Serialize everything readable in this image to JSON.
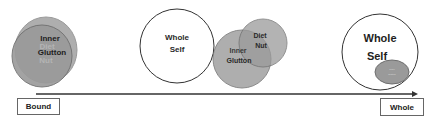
{
  "stages": {
    "bound": {
      "label": "Bound",
      "circles": [
        "Inner Glutton",
        "Diet Nut"
      ],
      "text_lines": [
        "Inner",
        "Diet",
        "Glutton",
        "Nut"
      ]
    },
    "middle": {
      "whole_self_lines": [
        "Whole",
        "Self"
      ],
      "inner_glutton_lines": [
        "Inner",
        "Glutton"
      ],
      "diet_nut_lines": [
        "Diet",
        "Nut"
      ]
    },
    "whole": {
      "label": "Whole",
      "whole_self_lines": [
        "Whole",
        "Self"
      ],
      "small_ellipse_lines": [
        "inner",
        "glutton"
      ]
    }
  },
  "axis": {
    "start_label": "Bound",
    "end_label": "Whole"
  },
  "colors": {
    "gray_fill": "#9a9a9a",
    "gray_stroke": "#777777",
    "outline": "#333333",
    "arrow": "#333333"
  }
}
